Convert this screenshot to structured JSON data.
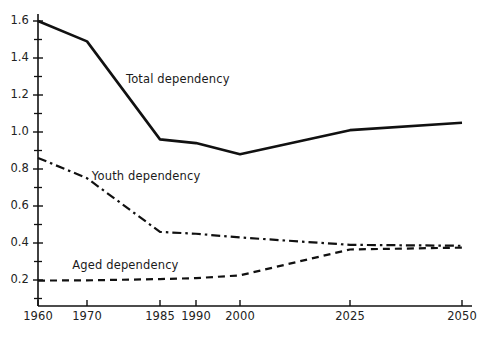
{
  "chart_data": {
    "type": "line",
    "title": "",
    "subtitle": "",
    "xlabel": "",
    "ylabel": "",
    "xlim": [
      1960,
      2050
    ],
    "ylim": [
      0.0,
      1.7
    ],
    "yticks": [
      0.2,
      0.4,
      0.6,
      0.8,
      1.0,
      1.2,
      1.4,
      1.6
    ],
    "ytick_labels": [
      "0.2",
      "0.4",
      "0.6",
      "0.8",
      "1.0",
      "1.2",
      "1.4",
      "1.6"
    ],
    "y_minor_ticks": [
      0.1,
      0.3,
      0.5,
      0.7,
      0.9,
      1.1,
      1.3,
      1.5,
      1.7
    ],
    "xticks": [
      1960,
      1970,
      1985,
      1990,
      2000,
      2025,
      2050
    ],
    "xtick_labels": [
      "1960",
      "1970",
      "1985",
      "1990",
      "2000",
      "2025",
      "2050"
    ],
    "grid": false,
    "legend_position": "inline-annotations",
    "x": [
      1960,
      1970,
      1985,
      1990,
      2000,
      2025,
      2050
    ],
    "series": [
      {
        "name": "Total dependency",
        "label": "Total dependency",
        "style": "solid",
        "color": "#111111",
        "values": [
          1.6,
          1.49,
          0.96,
          0.94,
          0.88,
          1.01,
          1.05
        ]
      },
      {
        "name": "Youth dependency",
        "label": "Youth dependency",
        "style": "dash-dot",
        "color": "#111111",
        "values": [
          0.86,
          0.75,
          0.46,
          0.45,
          0.43,
          0.39,
          0.385
        ]
      },
      {
        "name": "Aged dependency",
        "label": "Aged dependency",
        "style": "dashed",
        "color": "#111111",
        "values": [
          0.197,
          0.198,
          0.205,
          0.21,
          0.225,
          0.365,
          0.375
        ]
      }
    ],
    "annotations": [
      {
        "text": "Total dependency",
        "x": 1978,
        "y": 1.28
      },
      {
        "text": "Youth dependency",
        "x": 1971,
        "y": 0.755
      },
      {
        "text": "Aged dependency",
        "x": 1967,
        "y": 0.275
      }
    ]
  }
}
